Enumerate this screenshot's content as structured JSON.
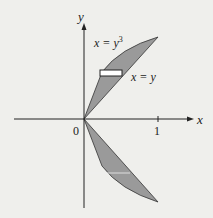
{
  "axes": {
    "x_label": "x",
    "y_label": "y",
    "origin_label": "0",
    "x_tick_label": "1"
  },
  "curves": {
    "upper_curve_label": "x = y",
    "upper_curve_exp": "3",
    "line_label": "x = y"
  },
  "colors": {
    "region_fill": "#9a9a9a",
    "rect_fill": "#ffffff",
    "axis": "#222222",
    "background": "#efefec"
  }
}
